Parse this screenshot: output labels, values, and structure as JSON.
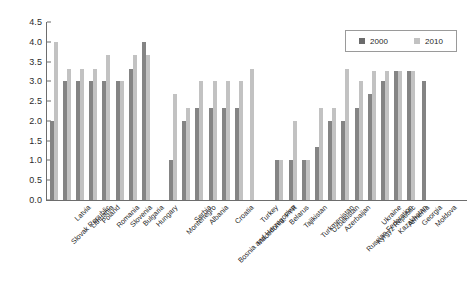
{
  "chart_data": {
    "type": "bar",
    "title": "",
    "subtitle": "",
    "xlabel": "",
    "ylabel": "",
    "ylim": [
      0,
      4.5
    ],
    "ytick_step": 0.5,
    "yticks": [
      "4.5",
      "4.0",
      "3.5",
      "3.0",
      "2.5",
      "2.0",
      "1.5",
      "1.0",
      "0.5",
      "0.0"
    ],
    "grid": false,
    "legend_position": "top-right",
    "legend": [
      "2000",
      "2010"
    ],
    "series": [
      {
        "name": "2000",
        "color": "#848484",
        "values": [
          2.0,
          3.0,
          3.0,
          3.0,
          3.0,
          3.0,
          3.3,
          4.0,
          1.0,
          2.0,
          2.33,
          2.33,
          2.33,
          2.33,
          null,
          1.0,
          1.0,
          1.0,
          1.33,
          2.0,
          2.0,
          2.33,
          2.67,
          3.0,
          3.25,
          3.25,
          3.0
        ]
      },
      {
        "name": "2010",
        "color": "#c2c2c2",
        "values": [
          4.0,
          3.3,
          3.3,
          3.3,
          3.67,
          3.0,
          3.67,
          3.67,
          2.67,
          2.33,
          3.0,
          3.0,
          3.0,
          3.0,
          3.3,
          1.0,
          2.0,
          1.0,
          2.33,
          2.33,
          3.3,
          3.0,
          3.25,
          3.25,
          3.25,
          3.25,
          null
        ]
      }
    ],
    "categories": [
      "Slovak Republic",
      "Latvia",
      "Lithuania",
      "Poland",
      "Romania",
      "Slovenia",
      "Bulgaria",
      "Hungary",
      "Montenegro",
      "Serbia",
      "Albania",
      "Bosnia and Herzegovina",
      "Croatia",
      "Macedonia, FYR",
      "Turkey",
      "Belarus",
      "Tajikistan",
      "Turkmenistan",
      "Uzbekistan",
      "Azerbaijan",
      "Russian Federation",
      "Kyrgyz Republic",
      "Ukraine",
      "Kazakhstan",
      "Armenia",
      "Georgia",
      "Moldova"
    ],
    "groups": [
      {
        "name": "group-1",
        "start": 0,
        "count": 8
      },
      {
        "name": "group-2",
        "start": 8,
        "count": 7
      },
      {
        "name": "group-3",
        "start": 15,
        "count": 12
      }
    ]
  }
}
